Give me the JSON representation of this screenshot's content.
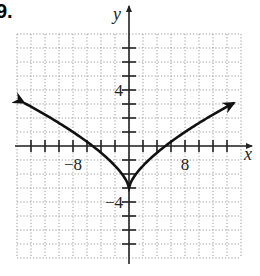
{
  "problem_label": "9.",
  "chart_data": {
    "type": "line",
    "title": "",
    "xlabel": "x",
    "ylabel": "y",
    "xlim": [
      -16,
      16
    ],
    "ylim": [
      -8,
      8
    ],
    "grid": true,
    "grid_spacing": {
      "x": 2,
      "y": 1
    },
    "x_ticks_every": 2,
    "y_ticks_every": 1,
    "tick_labels": {
      "x": [
        {
          "value": -8,
          "text": "−8"
        },
        {
          "value": 8,
          "text": "8"
        }
      ],
      "y": [
        {
          "value": 4,
          "text": "4"
        },
        {
          "value": -4,
          "text": "−4"
        }
      ]
    },
    "series": [
      {
        "name": "f(x)",
        "description": "V-shaped cusp curve with vertex at (0,-3), arrows at both ends",
        "vertex": [
          0,
          -3
        ],
        "x_intercepts": [
          -5.2,
          5.2
        ],
        "endpoints": [
          [
            -15,
            3.1
          ],
          [
            15,
            3.1
          ]
        ],
        "x": [
          -15,
          -12,
          -10,
          -8,
          -6,
          -4,
          -2,
          -1,
          0,
          1,
          2,
          4,
          6,
          8,
          10,
          12,
          15
        ],
        "values": [
          3.08,
          2.24,
          1.64,
          1.0,
          0.3,
          -0.48,
          -1.41,
          -2.0,
          -3.0,
          -2.0,
          -1.41,
          -0.48,
          0.3,
          1.0,
          1.64,
          2.24,
          3.08
        ]
      }
    ],
    "colors": {
      "curve": "#111111",
      "axes": "#222222",
      "grid": "#9a9a9a"
    }
  }
}
